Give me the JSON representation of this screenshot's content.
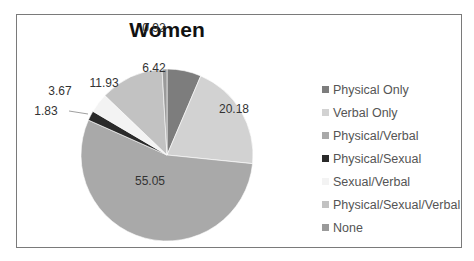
{
  "chart_data": {
    "type": "pie",
    "title": "Women",
    "categories": [
      "Physical Only",
      "Verbal Only",
      "Physical/Verbal",
      "Physical/Sexual",
      "Sexual/Verbal",
      "Physical/Sexual/Verbal",
      "None"
    ],
    "values": [
      6.42,
      20.18,
      55.05,
      1.83,
      3.67,
      11.93,
      0.92
    ],
    "colors": [
      "#7d7d7d",
      "#d2d2d2",
      "#a9a9a9",
      "#2a2a2a",
      "#f3f3f3",
      "#c2c2c2",
      "#9a9a9a"
    ],
    "legend_position": "right",
    "data_labels": [
      "6.42",
      "20.18",
      "55.05",
      "1.83",
      "3.67",
      "11.93",
      "0.92"
    ]
  },
  "title": "Women",
  "legend": [
    {
      "label": "Physical Only",
      "color": "#7d7d7d"
    },
    {
      "label": "Verbal Only",
      "color": "#d2d2d2"
    },
    {
      "label": "Physical/Verbal",
      "color": "#a9a9a9"
    },
    {
      "label": "Physical/Sexual",
      "color": "#2a2a2a"
    },
    {
      "label": "Sexual/Verbal",
      "color": "#f3f3f3"
    },
    {
      "label": "Physical/Sexual/Verbal",
      "color": "#c2c2c2"
    },
    {
      "label": "None",
      "color": "#9a9a9a"
    }
  ]
}
